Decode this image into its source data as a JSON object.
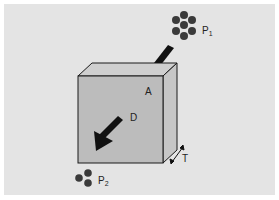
{
  "diagram": {
    "labels": {
      "p1": "P",
      "p1_sub": "1",
      "p2": "P",
      "p2_sub": "2",
      "area": "A",
      "diffusion": "D",
      "thickness": "T"
    },
    "colors": {
      "background": "#e4e4e4",
      "cube_front": "#bcbcbc",
      "cube_top": "#cfcfcf",
      "cube_side": "#c6c6c6",
      "outline": "#1a1a1a",
      "particles": "#3a3a3a",
      "arrow": "#111111"
    },
    "particle_groups": [
      {
        "name": "P1",
        "count": 7
      },
      {
        "name": "P2",
        "count": 3
      }
    ]
  }
}
